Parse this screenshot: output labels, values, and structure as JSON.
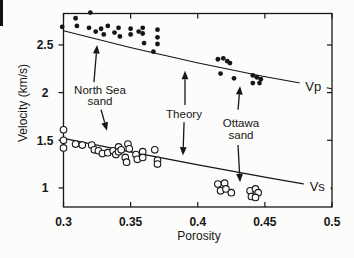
{
  "figure": {
    "background": "#fcfcfa",
    "ink": "#161616"
  },
  "chart_data": {
    "type": "scatter",
    "title": "",
    "xlabel": "Porosity",
    "ylabel": "Velocity (km/s)",
    "xlim": [
      0.3,
      0.5
    ],
    "ylim": [
      0.8,
      2.83
    ],
    "x_ticks": [
      "0.3",
      "0.35",
      "0.4",
      "0.45",
      "0.5"
    ],
    "x_tick_values": [
      0.3,
      0.35,
      0.4,
      0.45,
      0.5
    ],
    "y_ticks": [
      "1",
      "1.5",
      "2",
      "2.5"
    ],
    "y_tick_values": [
      1,
      1.5,
      2,
      2.5
    ],
    "grid": false,
    "legend": "none",
    "series": [
      {
        "name": "Vp measurements",
        "marker": "filled-circle",
        "groups": [
          "North Sea sand",
          "Ottawa sand"
        ],
        "points": [
          [
            0.299,
            2.69
          ],
          [
            0.309,
            2.78
          ],
          [
            0.31,
            2.7
          ],
          [
            0.32,
            2.84
          ],
          [
            0.319,
            2.68
          ],
          [
            0.324,
            2.64
          ],
          [
            0.328,
            2.67
          ],
          [
            0.33,
            2.61
          ],
          [
            0.333,
            2.7
          ],
          [
            0.338,
            2.63
          ],
          [
            0.341,
            2.68
          ],
          [
            0.342,
            2.59
          ],
          [
            0.35,
            2.67
          ],
          [
            0.35,
            2.61
          ],
          [
            0.356,
            2.64
          ],
          [
            0.359,
            2.68
          ],
          [
            0.359,
            2.62
          ],
          [
            0.36,
            2.52
          ],
          [
            0.37,
            2.66
          ],
          [
            0.37,
            2.58
          ],
          [
            0.37,
            2.51
          ],
          [
            0.367,
            2.43
          ],
          [
            0.415,
            2.35
          ],
          [
            0.419,
            2.36
          ],
          [
            0.422,
            2.33
          ],
          [
            0.424,
            2.31
          ],
          [
            0.417,
            2.2
          ],
          [
            0.427,
            2.15
          ],
          [
            0.441,
            2.18
          ],
          [
            0.444,
            2.16
          ],
          [
            0.447,
            2.14
          ],
          [
            0.441,
            2.1
          ],
          [
            0.446,
            2.1
          ]
        ]
      },
      {
        "name": "Vs measurements",
        "marker": "open-circle",
        "groups": [
          "North Sea sand",
          "Ottawa sand"
        ],
        "points": [
          [
            0.3,
            1.61
          ],
          [
            0.3,
            1.5
          ],
          [
            0.3,
            1.42
          ],
          [
            0.309,
            1.46
          ],
          [
            0.314,
            1.45
          ],
          [
            0.321,
            1.45
          ],
          [
            0.323,
            1.4
          ],
          [
            0.326,
            1.39
          ],
          [
            0.329,
            1.36
          ],
          [
            0.333,
            1.37
          ],
          [
            0.337,
            1.39
          ],
          [
            0.339,
            1.35
          ],
          [
            0.341,
            1.43
          ],
          [
            0.341,
            1.38
          ],
          [
            0.343,
            1.4
          ],
          [
            0.346,
            1.32
          ],
          [
            0.347,
            1.27
          ],
          [
            0.348,
            1.46
          ],
          [
            0.349,
            1.41
          ],
          [
            0.354,
            1.35
          ],
          [
            0.355,
            1.3
          ],
          [
            0.359,
            1.38
          ],
          [
            0.359,
            1.32
          ],
          [
            0.368,
            1.4
          ],
          [
            0.37,
            1.29
          ],
          [
            0.37,
            1.25
          ],
          [
            0.415,
            1.04
          ],
          [
            0.42,
            1.05
          ],
          [
            0.417,
            0.97
          ],
          [
            0.421,
            0.99
          ],
          [
            0.425,
            0.95
          ],
          [
            0.439,
            0.97
          ],
          [
            0.443,
            0.99
          ],
          [
            0.445,
            0.95
          ],
          [
            0.44,
            0.91
          ],
          [
            0.443,
            0.9
          ]
        ]
      }
    ],
    "theory_curves": [
      {
        "name": "Vp theory curve",
        "label": "Vp",
        "start": [
          0.3,
          2.65
        ],
        "control": [
          0.4,
          2.28
        ],
        "end": [
          0.5,
          2.04
        ],
        "label_at": [
          0.486,
          2.065
        ]
      },
      {
        "name": "Vs theory curve",
        "label": "Vs",
        "start": [
          0.3,
          1.52
        ],
        "control": [
          0.4,
          1.23
        ],
        "end": [
          0.5,
          0.99
        ],
        "label_at": [
          0.489,
          1.01
        ]
      }
    ],
    "annotations": [
      {
        "lines": [
          "North Sea",
          "sand"
        ],
        "at": [
          0.327,
          1.97
        ],
        "arrows": [
          {
            "from": [
              0.3227,
              2.11
            ],
            "to": [
              0.325,
              2.5
            ]
          },
          {
            "from": [
              0.328,
              1.82
            ],
            "to": [
              0.3324,
              1.6
            ]
          }
        ]
      },
      {
        "lines": [
          "Theory"
        ],
        "at": [
          0.39,
          1.78
        ],
        "arrows": [
          {
            "from": [
              0.3905,
              1.87
            ],
            "to": [
              0.3905,
              2.23
            ]
          },
          {
            "from": [
              0.3898,
              1.69
            ],
            "to": [
              0.389,
              1.34
            ]
          }
        ]
      },
      {
        "lines": [
          "Ottawa",
          "sand"
        ],
        "at": [
          0.4315,
          1.62
        ],
        "arrows": [
          {
            "from": [
              0.43,
              1.82
            ],
            "to": [
              0.4315,
              2.07
            ]
          },
          {
            "from": [
              0.43,
              1.45
            ],
            "to": [
              0.4315,
              1.06
            ]
          }
        ]
      }
    ]
  }
}
